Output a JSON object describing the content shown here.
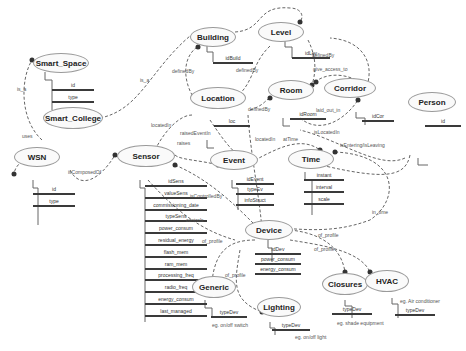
{
  "entities": {
    "smart_space": {
      "name": "Smart_Space",
      "attrs": [
        "id",
        "type"
      ]
    },
    "smart_college": {
      "name": "Smart_College"
    },
    "building": {
      "name": "Building",
      "attrs": [
        "idBuild"
      ]
    },
    "level": {
      "name": "Level",
      "attrs": [
        "idLev"
      ]
    },
    "location": {
      "name": "Location",
      "attrs": [
        "loc"
      ]
    },
    "room": {
      "name": "Room",
      "attrs": [
        "idRoom"
      ]
    },
    "corridor": {
      "name": "Corridor",
      "attrs": [
        "idCor"
      ]
    },
    "person": {
      "name": "Person",
      "attrs": [
        "id"
      ]
    },
    "wsn": {
      "name": "WSN",
      "attrs": [
        "id",
        "type"
      ]
    },
    "sensor": {
      "name": "Sensor",
      "attrs": [
        "idSens",
        "valueSens",
        "commissioning_date",
        "typeSens",
        "power_consum",
        "residual_energy",
        "flash_mem",
        "ram_mem",
        "processing_freq",
        "radio_freq",
        "energy_consum",
        "last_managed"
      ]
    },
    "event": {
      "name": "Event",
      "attrs": [
        "idEvent",
        "typeEv",
        "infoStruct"
      ]
    },
    "time": {
      "name": "Time",
      "attrs": [
        "instant",
        "interval",
        "scale"
      ]
    },
    "device": {
      "name": "Device",
      "attrs": [
        "idDev",
        "power_consum",
        "energy_consum"
      ]
    },
    "generic": {
      "name": "Generic",
      "attrs": [
        "typeDev"
      ],
      "note": "eg. on/off switch"
    },
    "lighting": {
      "name": "Lighting",
      "attrs": [
        "typeDev"
      ],
      "note": "eg. on/off light"
    },
    "closures": {
      "name": "Closures",
      "attrs": [
        "typeDev"
      ],
      "note": "eg. shade equipment"
    },
    "hvac": {
      "name": "HVAC",
      "attrs": [
        "typeDev"
      ],
      "note": "eg. Air conditioner"
    }
  },
  "relations": {
    "is_a_1": "is_a",
    "is_a_2": "is_a",
    "uses": "uses",
    "definedBy_1": "definedBy",
    "definedBy_2": "definedBy",
    "definedBy_3": "definedBy",
    "definedBy_4": "definedBy",
    "give_access_to": "give_access_to",
    "laid_out_in": "laid_out_in",
    "isLocatedIn": "isLocatedIn",
    "isEntering": "isEntering/isLeaving",
    "locatedIn_1": "locatedIn",
    "locatedIn_2": "locatedIn",
    "raisedEventIn": "raisedEventIn",
    "raises": "raises",
    "atTime": "atTime",
    "isComposedOf": "isComposedOf",
    "isControlledBy": "isControlledBy",
    "controls": "controls",
    "in_time": "in_time",
    "of_profile_1": "of_profile",
    "of_profile_2": "of_profile",
    "of_profile_3": "of_profile",
    "of_profile_4": "of_profile"
  }
}
